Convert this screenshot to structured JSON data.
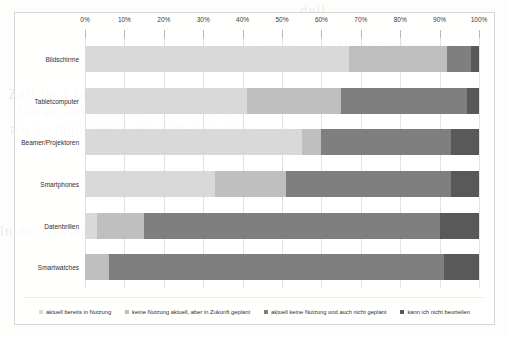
{
  "chart_data": {
    "type": "bar",
    "orientation": "horizontal",
    "stacked": true,
    "stacked_normalized": true,
    "title": "",
    "xlabel": "",
    "ylabel": "",
    "xlim": [
      0,
      100
    ],
    "xtick_labels": [
      "0%",
      "10%",
      "20%",
      "30%",
      "40%",
      "50%",
      "60%",
      "70%",
      "80%",
      "90%",
      "100%"
    ],
    "xtick_values": [
      0,
      10,
      20,
      30,
      40,
      50,
      60,
      70,
      80,
      90,
      100
    ],
    "grid": true,
    "legend_position": "bottom",
    "categories": [
      "Bildschirme",
      "Tabletcomputer",
      "Beamer/Projektoren",
      "Smartphones",
      "Datenbrillen",
      "Smartwatches"
    ],
    "series": [
      {
        "name": "aktuell bereits in Nutzung",
        "color": "#d9d9d9",
        "values": [
          67,
          41,
          55,
          33,
          3,
          0
        ]
      },
      {
        "name": "keine Nutzung aktuell, aber in Zukunft geplant",
        "color": "#bfbfbf",
        "values": [
          25,
          24,
          5,
          18,
          12,
          6
        ]
      },
      {
        "name": "aktuell keine Nutzung und auch nicht geplant",
        "color": "#7f7f7f",
        "values": [
          6,
          32,
          33,
          42,
          75,
          85
        ]
      },
      {
        "name": "kann ich nicht beurteilen",
        "color": "#595959",
        "values": [
          2,
          3,
          7,
          7,
          10,
          9
        ]
      }
    ]
  },
  "bleed_text": {
    "line1": "dell",
    "line2": "Zeit im Einsatz haben. Einige Lehrer",
    "line3": "Geräte aufgrund ihrer persönlichen",
    "line4": "ten zu implementieren und zu nutzen",
    "line5": "Nutzung von Videokonferenzen",
    "line6": "ln der Aussage zur Nutzung"
  },
  "legend": {
    "items": [
      {
        "label": "aktuell bereits in Nutzung",
        "color": "#d9d9d9"
      },
      {
        "label": "keine Nutzung aktuell, aber in Zukunft geplant",
        "color": "#bfbfbf"
      },
      {
        "label": "aktuell keine Nutzung und auch nicht geplant",
        "color": "#7f7f7f"
      },
      {
        "label": "kann ich nicht beurteilen",
        "color": "#595959"
      }
    ]
  }
}
